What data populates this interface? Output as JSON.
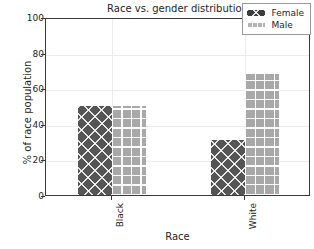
{
  "chart_data": {
    "type": "bar",
    "title": "Race vs. gender distribution",
    "xlabel": "Race",
    "ylabel": "% of race population",
    "categories": [
      "Black",
      "White"
    ],
    "series": [
      {
        "name": "Female",
        "values": [
          50,
          31
        ],
        "color": "#555555",
        "hatch": "x"
      },
      {
        "name": "Male",
        "values": [
          50,
          68
        ],
        "color": "#a8a8a8",
        "hatch": "+"
      }
    ],
    "ylim": [
      0,
      100
    ],
    "yticks": [
      0,
      20,
      40,
      60,
      80,
      100
    ],
    "ytick_labels": [
      "0",
      "20",
      "40",
      "60",
      "80",
      "100"
    ],
    "grid": true,
    "legend_position": "upper right"
  },
  "legend": {
    "entries": [
      {
        "label": "Female"
      },
      {
        "label": "Male"
      }
    ]
  }
}
